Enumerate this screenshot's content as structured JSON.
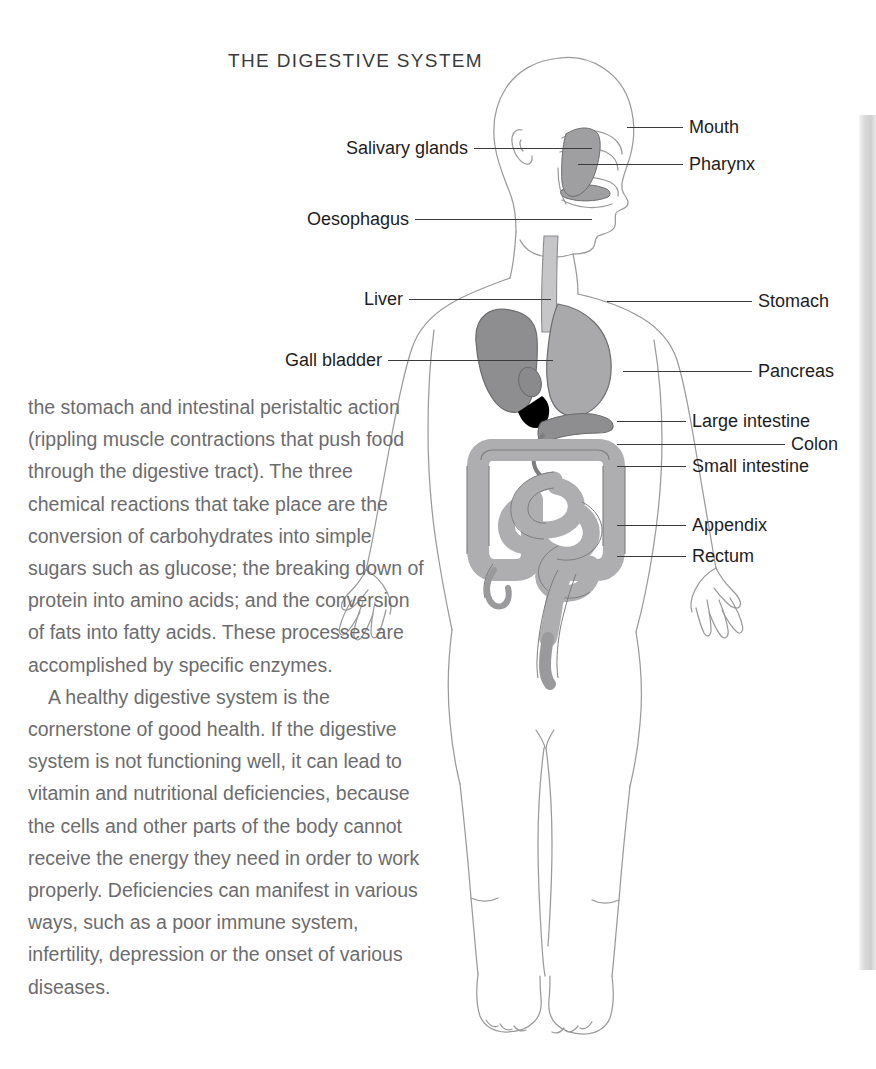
{
  "page": {
    "title": "THE DIGESTIVE SYSTEM",
    "background_color": "#ffffff",
    "edge_strip_color": "#d9d9d9"
  },
  "body_copy": {
    "paragraphs": [
      "the stomach and intestinal peristaltic action (rippling muscle contractions that push food through the digestive tract). The three chemical reactions that take place are the conversion of carbohydrates into simple sugars such as glucose; the breaking down of protein into amino acids; and the conversion of fats into fatty acids. These processes are accomplished by specific enzymes.",
      "A healthy digestive system is the cornerstone of good health. If the digestive system is not functioning well, it can lead to vitamin and nutritional deficiencies, because the cells and other parts of the body cannot receive the energy they need in order to work properly. Deficiencies can manifest in various ways, such as a poor immune system, infertility, depression or the onset of various diseases."
    ]
  },
  "diagram": {
    "alt": "full-body outline of a human figure shown front-on with the head in profile, the digestive organs shaded in grey",
    "outline_color": "#9a9a9c",
    "organ_colors": {
      "liver": "#8e8e90",
      "stomach": "#a9a9ab",
      "gall_bladder": "#8a8a8c",
      "pancreas": "#8e8e90",
      "intestine": "#aeaeb0",
      "mouth_cavity": "#9f9fa1",
      "oesophagus": "#c0c0c2"
    },
    "labels_left": [
      {
        "text": "Salivary glands",
        "name": "salivary-glands"
      },
      {
        "text": "Oesophagus",
        "name": "oesophagus"
      },
      {
        "text": "Liver",
        "name": "liver"
      },
      {
        "text": "Gall bladder",
        "name": "gall-bladder"
      }
    ],
    "labels_right": [
      {
        "text": "Mouth",
        "name": "mouth"
      },
      {
        "text": "Pharynx",
        "name": "pharynx"
      },
      {
        "text": "Stomach",
        "name": "stomach"
      },
      {
        "text": "Pancreas",
        "name": "pancreas"
      },
      {
        "text": "Large intestine",
        "name": "large-intestine"
      },
      {
        "text": "Colon",
        "name": "colon"
      },
      {
        "text": "Small intestine",
        "name": "small-intestine"
      },
      {
        "text": "Appendix",
        "name": "appendix"
      },
      {
        "text": "Rectum",
        "name": "rectum"
      }
    ]
  }
}
